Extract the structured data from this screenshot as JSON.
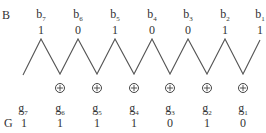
{
  "binary": {
    "label": "B",
    "bits": [
      {
        "name": "b",
        "sub": "7",
        "value": "1"
      },
      {
        "name": "b",
        "sub": "6",
        "value": "0"
      },
      {
        "name": "b",
        "sub": "5",
        "value": "1"
      },
      {
        "name": "b",
        "sub": "4",
        "value": "0"
      },
      {
        "name": "b",
        "sub": "3",
        "value": "0"
      },
      {
        "name": "b",
        "sub": "2",
        "value": "1"
      },
      {
        "name": "b",
        "sub": "1",
        "value": "1"
      }
    ]
  },
  "gray": {
    "label": "G",
    "bits": [
      {
        "name": "g",
        "sub": "7",
        "value": "1"
      },
      {
        "name": "g",
        "sub": "6",
        "value": "1"
      },
      {
        "name": "g",
        "sub": "5",
        "value": "1"
      },
      {
        "name": "g",
        "sub": "4",
        "value": "1"
      },
      {
        "name": "g",
        "sub": "3",
        "value": "0"
      },
      {
        "name": "g",
        "sub": "2",
        "value": "1"
      },
      {
        "name": "g",
        "sub": "1",
        "value": "0"
      }
    ]
  },
  "operator": {
    "symbol": "xor-circle-plus",
    "count": 6
  },
  "colors": {
    "line": "#555555",
    "text": "#333333"
  }
}
